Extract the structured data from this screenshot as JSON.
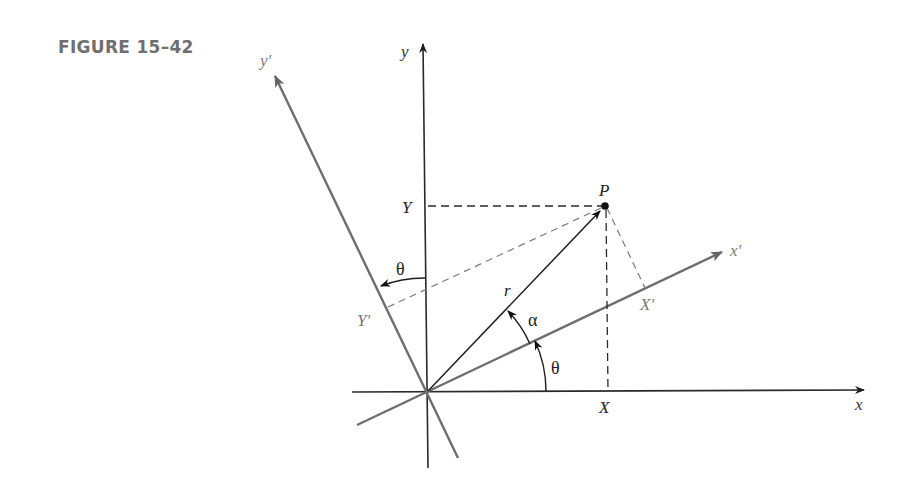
{
  "figure": {
    "title": "FIGURE 15–42"
  },
  "colors": {
    "axis": "#2a2a2a",
    "rotated_axis": "#6e6e6e",
    "title": "#6f6f6f",
    "label_gray": "#7a7a7a",
    "label_dark": "#222222"
  },
  "labels": {
    "x_axis": "x",
    "y_axis": "y",
    "x_prime_axis": "x′",
    "y_prime_axis": "y′",
    "point": "P",
    "X": "X",
    "Y": "Y",
    "X_prime": "X′",
    "Y_prime": "Y′",
    "radius": "r",
    "alpha": "α",
    "theta_bottom": "θ",
    "theta_top": "θ"
  },
  "geometry": {
    "origin": [
      427,
      392
    ],
    "point_P": [
      605,
      206
    ],
    "rotation_angle_deg": 25.4
  }
}
